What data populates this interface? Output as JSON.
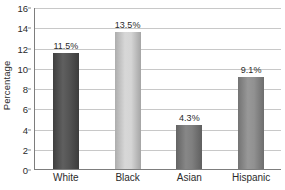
{
  "chart_data": {
    "type": "bar",
    "title": "",
    "subtitle": "",
    "xlabel": "",
    "ylabel": "Percentage",
    "categories": [
      "White",
      "Black",
      "Asian",
      "Hispanic"
    ],
    "values": [
      11.5,
      13.5,
      4.3,
      9.1
    ],
    "data_labels": [
      "11.5%",
      "13.5%",
      "4.3%",
      "9.1%"
    ],
    "bar_colors": [
      "#4d4d4d",
      "#d3d3d3",
      "#7a7a7a",
      "#8c8c8c"
    ],
    "ylim": [
      0,
      16
    ],
    "ytick_step": 2,
    "ytick_labels": [
      "0",
      "2",
      "4",
      "6",
      "8",
      "10",
      "12",
      "14",
      "16"
    ],
    "ytick_values": [
      0,
      2,
      4,
      6,
      8,
      10,
      12,
      14,
      16
    ],
    "grid": true,
    "grid_axis": "y",
    "grid_color": "#c8c8c8",
    "legend": false,
    "legend_position": "none",
    "axis_line_color": "#7d7d7d",
    "text_color": "#2b2b2b",
    "background_color": "#ffffff"
  }
}
